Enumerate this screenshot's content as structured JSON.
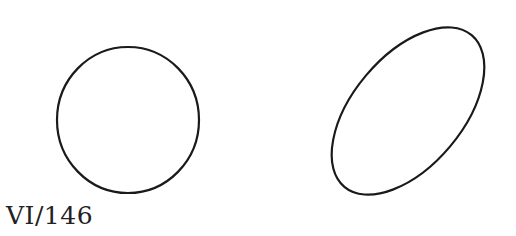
{
  "figure": {
    "label": "VI/146",
    "stroke_color": "#1a1a1a",
    "shapes": [
      {
        "type": "circle",
        "cx": 128,
        "cy": 120,
        "rx": 71,
        "ry": 73,
        "rotation": 0
      },
      {
        "type": "ellipse",
        "cx": 408,
        "cy": 111,
        "rx": 99,
        "ry": 55,
        "rotation": -50
      }
    ]
  }
}
